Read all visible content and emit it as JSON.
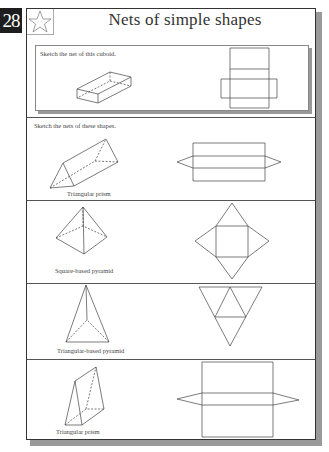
{
  "page": {
    "number": "28",
    "title": "Nets of simple shapes",
    "icon": "star-icon"
  },
  "section1": {
    "instruction": "Sketch the net of this cuboid.",
    "shape": "cuboid"
  },
  "section2": {
    "instruction": "Sketch the nets of these shapes.",
    "shapes": [
      {
        "label": "Triangular prism"
      },
      {
        "label": "Square-based pyramid"
      },
      {
        "label": "Triangular-based pyramid"
      },
      {
        "label": "Triangular prism"
      }
    ]
  },
  "colors": {
    "line": "#444444",
    "shadow": "#999999",
    "page_number_bg": "#1e1e1e"
  }
}
